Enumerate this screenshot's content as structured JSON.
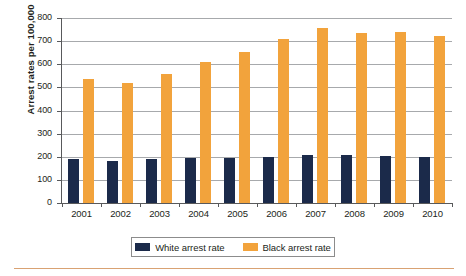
{
  "chart_data": {
    "type": "bar",
    "title": "",
    "xlabel": "",
    "ylabel": "Arrest rates per 100,000",
    "categories": [
      "2001",
      "2002",
      "2003",
      "2004",
      "2005",
      "2006",
      "2007",
      "2008",
      "2009",
      "2010"
    ],
    "series": [
      {
        "name": "White arrest rate",
        "color": "#1b2a4a",
        "values": [
          190,
          183,
          192,
          195,
          194,
          200,
          207,
          207,
          203,
          200
        ]
      },
      {
        "name": "Black arrest rate",
        "color": "#f2a33c",
        "values": [
          537,
          521,
          557,
          609,
          655,
          711,
          757,
          734,
          740,
          723
        ]
      }
    ],
    "ylim": [
      0,
      800
    ],
    "yticks": [
      "0",
      "100",
      "200",
      "300",
      "400",
      "500",
      "600",
      "700",
      "800"
    ],
    "ytick_values": [
      0,
      100,
      200,
      300,
      400,
      500,
      600,
      700,
      800
    ],
    "grid": true,
    "legend_position": "bottom"
  },
  "legend": {
    "entries": [
      {
        "label": "White arrest rate"
      },
      {
        "label": "Black arrest rate"
      }
    ]
  },
  "colors": {
    "white_rate": "#1b2a4a",
    "black_rate": "#f2a33c",
    "gridline": "#a7a9ac",
    "axis": "#58595b",
    "rule": "#d9a273"
  }
}
